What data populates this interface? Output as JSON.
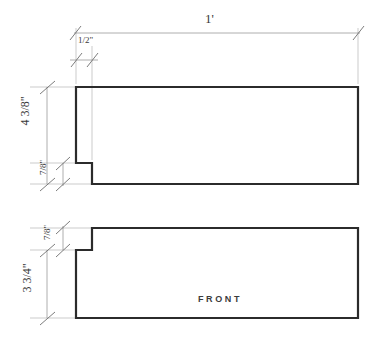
{
  "drawing": {
    "title_text": "FRONT",
    "style": {
      "object_line_color": "#2b2b2b",
      "dimension_line_color": "#9a9a9a",
      "tick_color": "#6e6e6e",
      "background": "#ffffff",
      "object_line_width": 2.2,
      "dimension_line_width": 0.8
    },
    "dimensions": [
      {
        "id": "overall-width",
        "label": "1'",
        "whole": "1",
        "fraction": "",
        "unit": "'",
        "orientation": "horizontal",
        "value_inches": 12,
        "line": {
          "x1": 74,
          "y1": 33,
          "x2": 360,
          "y2": 33
        }
      },
      {
        "id": "notch-width",
        "label": "1/2\"",
        "whole": "",
        "numerator": "1",
        "denominator": "2",
        "unit": "\"",
        "orientation": "horizontal",
        "value_inches": 0.5,
        "line": {
          "x1": 70,
          "y1": 60,
          "x2": 98,
          "y2": 60
        }
      },
      {
        "id": "upper-height",
        "label": "4 3/8\"",
        "whole": "4",
        "numerator": "3",
        "denominator": "8",
        "unit": "\"",
        "orientation": "vertical",
        "value_inches": 4.375,
        "line": {
          "x1": 47,
          "y1": 87,
          "x2": 47,
          "y2": 184
        }
      },
      {
        "id": "upper-notch-height",
        "label": "7/8\"",
        "whole": "",
        "numerator": "7",
        "denominator": "8",
        "unit": "\"",
        "orientation": "vertical",
        "value_inches": 0.875,
        "line": {
          "x1": 63,
          "y1": 163,
          "x2": 63,
          "y2": 184
        }
      },
      {
        "id": "lower-notch-height",
        "label": "7/8\"",
        "whole": "",
        "numerator": "7",
        "denominator": "8",
        "unit": "\"",
        "orientation": "vertical",
        "value_inches": 0.875,
        "line": {
          "x1": 63,
          "y1": 228,
          "x2": 63,
          "y2": 250
        }
      },
      {
        "id": "lower-height",
        "label": "3 3/4\"",
        "whole": "3",
        "numerator": "3",
        "denominator": "4",
        "unit": "\"",
        "orientation": "vertical",
        "value_inches": 3.75,
        "line": {
          "x1": 47,
          "y1": 250,
          "x2": 47,
          "y2": 318
        }
      }
    ],
    "views": [
      {
        "id": "upper-profile",
        "name": "top-board-profile",
        "outline": "M 76,87 L 358,87 L 358,184 L 92,184 L 92,163 L 76,163 Z"
      },
      {
        "id": "lower-profile",
        "name": "front-board-profile",
        "outline": "M 92,228 L 358,228 L 358,318 L 76,318 L 76,250 L 92,250 Z"
      }
    ]
  }
}
